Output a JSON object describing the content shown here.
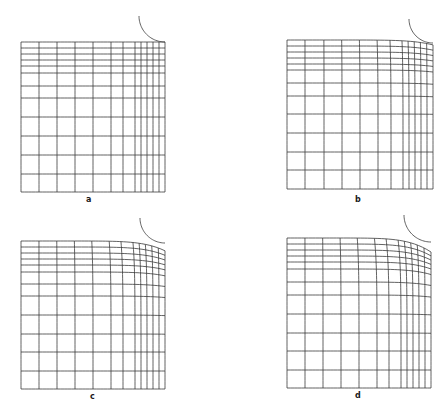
{
  "figure": {
    "line_color": "#3a3a3a",
    "background": "#ffffff",
    "panels": [
      {
        "id": "a",
        "label": "a",
        "label_pos": [
          86,
          201
        ],
        "bounds": {
          "left": 21,
          "top": 42,
          "right": 165,
          "bottom": 192
        },
        "x_lines": [
          21,
          39,
          57,
          75,
          93,
          111,
          123,
          135,
          141,
          147,
          153,
          159,
          165
        ],
        "y_lines": [
          42,
          48,
          54,
          60,
          66,
          73,
          86,
          98,
          117,
          136,
          155,
          174,
          192
        ],
        "distortion": 0,
        "arc": {
          "cx": 165,
          "cy": 16,
          "r": 26,
          "start_deg": 180,
          "end_deg": 90
        }
      },
      {
        "id": "b",
        "label": "b",
        "label_pos": [
          355,
          201
        ],
        "bounds": {
          "left": 287,
          "top": 40,
          "right": 433,
          "bottom": 189
        },
        "x_lines": [
          287,
          305,
          324,
          342,
          360,
          378,
          391,
          403,
          409,
          415,
          421,
          427,
          433
        ],
        "y_lines": [
          40,
          46,
          52,
          58,
          64,
          70,
          83,
          96,
          114,
          133,
          152,
          170,
          189
        ],
        "distortion": 0.35,
        "arc": {
          "cx": 433,
          "cy": 19,
          "r": 24,
          "start_deg": 180,
          "end_deg": 90
        }
      },
      {
        "id": "c",
        "label": "c",
        "label_pos": [
          90,
          398
        ],
        "bounds": {
          "left": 21,
          "top": 241,
          "right": 165,
          "bottom": 389
        },
        "x_lines": [
          21,
          39,
          57,
          75,
          93,
          111,
          123,
          135,
          141,
          147,
          153,
          159,
          165
        ],
        "y_lines": [
          241,
          247,
          253,
          259,
          265,
          272,
          284,
          296,
          315,
          334,
          352,
          371,
          389
        ],
        "distortion": 0.7,
        "arc": {
          "cx": 165,
          "cy": 218,
          "r": 25,
          "start_deg": 180,
          "end_deg": 90
        }
      },
      {
        "id": "d",
        "label": "d",
        "label_pos": [
          355,
          397
        ],
        "bounds": {
          "left": 287,
          "top": 238,
          "right": 431,
          "bottom": 388
        },
        "x_lines": [
          287,
          305,
          323,
          341,
          359,
          377,
          389,
          401,
          407,
          413,
          419,
          425,
          431
        ],
        "y_lines": [
          238,
          244,
          250,
          256,
          262,
          269,
          282,
          295,
          314,
          333,
          351,
          370,
          388
        ],
        "distortion": 1.0,
        "arc": {
          "cx": 431,
          "cy": 215,
          "r": 27,
          "start_deg": 180,
          "end_deg": 90
        }
      }
    ]
  }
}
